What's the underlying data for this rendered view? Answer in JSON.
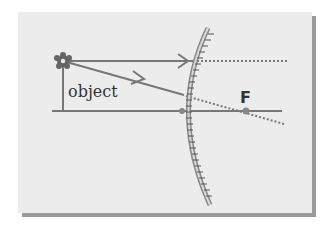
{
  "diagram": {
    "labels": {
      "object": "object",
      "focal_point": "F"
    },
    "colors": {
      "background": "#ececec",
      "shadow": "#9a9a9a",
      "ray": "#777777",
      "mirror": "#888888",
      "text": "#333333"
    },
    "elements": [
      {
        "type": "object",
        "name": "object arrow with flower",
        "x": 63,
        "top_y": 61
      },
      {
        "type": "principal-axis",
        "y": 111
      },
      {
        "type": "convex-mirror",
        "hatched": true
      },
      {
        "type": "ray",
        "desc": "parallel ray reflected, virtual extension dotted"
      },
      {
        "type": "ray",
        "desc": "ray toward F reflected, virtual extension dotted through F"
      },
      {
        "type": "focal-point",
        "x": 246,
        "y": 111
      }
    ]
  }
}
